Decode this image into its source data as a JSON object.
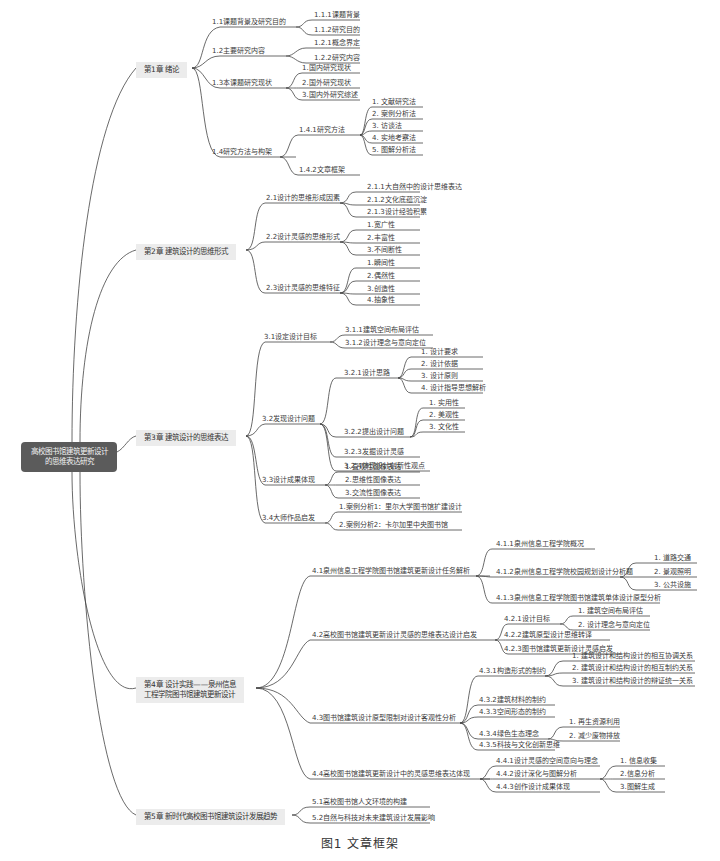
{
  "root": {
    "line1": "高校图书馆建筑更新设计",
    "line2": "的思维表达研究"
  },
  "colors": {
    "root_bg": "#5b5b5b",
    "chapter_bg": "#ececec",
    "line": "#444444"
  },
  "chapters": [
    {
      "label": "第1章 绪论",
      "sections": [
        {
          "label": "1.1课题背景及研究目的",
          "items": [
            "1.1.1课题背景",
            "1.1.2研究目的"
          ]
        },
        {
          "label": "1.2主要研究内容",
          "items": [
            "1.2.1概念界定",
            "1.2.2研究内容"
          ]
        },
        {
          "label": "1.3本课题研究现状",
          "items": [
            "1.国内研究现状",
            "2.国外研究现状",
            "3.国内外研究综述"
          ]
        },
        {
          "label": "1.4研究方法与构架",
          "sub": [
            {
              "label": "1.4.1研究方法",
              "items": [
                "1. 文献研究法",
                "2. 案例分析法",
                "3. 访谈法",
                "4. 实地考察法",
                "5. 图解分析法"
              ]
            },
            {
              "label": "1.4.2文章框架"
            }
          ]
        }
      ]
    },
    {
      "label": "第2章 建筑设计的思维形式",
      "sections": [
        {
          "label": "2.1设计的思维形成因素",
          "items": [
            "2.1.1大自然中的设计思维表达",
            "2.1.2文化底蕴沉淀",
            "2.1.3设计经验积累"
          ]
        },
        {
          "label": "2.2设计灵感的思维形式",
          "items": [
            "1.宽广性",
            "2.丰富性",
            "3.不间断性"
          ]
        },
        {
          "label": "2.3设计灵感的思维特征",
          "items": [
            "1.瞬间性",
            "2.偶然性",
            "3.创造性",
            "4.抽象性"
          ]
        }
      ]
    },
    {
      "label": "第3章 建筑设计的思维表达",
      "sections": [
        {
          "label": "3.1设定设计目标",
          "items": [
            "3.1.1建筑空间布局评估",
            "3.1.2设计理念与意向定位"
          ]
        },
        {
          "label": "3.2发现设计问题",
          "sub": [
            {
              "label": "3.2.1设计思路",
              "items": [
                "1. 设计要求",
                "2. 设计依据",
                "3. 设计原则",
                "4. 设计指导思想解析"
              ]
            },
            {
              "label": "3.2.2提出设计问题",
              "items": [
                "1. 实用性",
                "2. 美观性",
                "3. 文化性"
              ]
            },
            {
              "label": "3.2.3发掘设计灵感"
            },
            {
              "label": "3.2.4体现设计创新性观点"
            }
          ]
        },
        {
          "label": "3.3设计成果体现",
          "items": [
            "1.直观性图像表达",
            "2.思维性图像表达",
            "3.交流性图像表达"
          ]
        },
        {
          "label": "3.4大师作品启发",
          "items": [
            "1.案例分析1：里尔大学图书馆扩建设计",
            "2.案例分析2：卡尔加里中央图书馆"
          ]
        }
      ]
    },
    {
      "label_line1": "第4章 设计实践——泉州信息",
      "label_line2": "工程学院图书馆建筑更新设计",
      "sections": [
        {
          "label": "4.1泉州信息工程学院图书馆建筑更新设计任务解析",
          "sub": [
            {
              "label": "4.1.1泉州信息工程学院概况"
            },
            {
              "label": "4.1.2泉州信息工程学院校园规划设计分析题",
              "items": [
                "1. 道路交通",
                "2. 景观照明",
                "3. 公共设施"
              ]
            },
            {
              "label": "4.1.3泉州信息工程学院图书馆建筑单体设计原型分析"
            }
          ]
        },
        {
          "label": "4.2高校图书馆建筑更新设计灵感的思维表达设计启发",
          "sub": [
            {
              "label": "4.2.1设计目标",
              "items": [
                "1. 建筑空间布局评估",
                "2. 设计理念与意向定位"
              ]
            },
            {
              "label": "4.2.2建筑原型设计思维转译"
            },
            {
              "label": "4.2.3图书馆建筑更新设计灵感启发"
            }
          ]
        },
        {
          "label": "4.3图书馆建筑设计原型限制对设计客观性分析",
          "sub": [
            {
              "label": "4.3.1构造形式的制约",
              "items": [
                "1. 建筑设计和结构设计的相互协调关系",
                "2. 建筑设计和结构设计的相互制约关系",
                "3. 建筑设计和结构设计的辩证统一关系"
              ]
            },
            {
              "label": "4.3.2建筑材料的制约"
            },
            {
              "label": "4.3.3空间形态的制约"
            },
            {
              "label": "4.3.4绿色生态理念",
              "items": [
                "1. 再生资源利用",
                "2. 减少废物排放"
              ]
            },
            {
              "label": "4.3.5科技与文化创新思维"
            }
          ]
        },
        {
          "label": "4.4高校图书馆建筑更新设计中的灵感思维表达体现",
          "sub": [
            {
              "label": "4.4.1设计灵感的空间意向与理念"
            },
            {
              "label": "4.4.2设计深化与图解分析",
              "items": [
                "1. 信息收集",
                "2.信息分析",
                "3.图解生成"
              ]
            },
            {
              "label": "4.4.3创作设计成果体现"
            }
          ]
        }
      ]
    },
    {
      "label": "第5章 新时代高校图书馆建筑设计发展趋势",
      "sections": [
        {
          "label": "5.1高校图书馆人文环境的构建"
        },
        {
          "label": "5.2自然与科技对未来建筑设计发展影响"
        }
      ]
    }
  ],
  "caption": "图1  文章框架"
}
